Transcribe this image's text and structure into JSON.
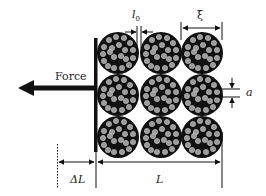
{
  "diagram": {
    "type": "mechanical-schematic",
    "labels": {
      "force": "Force",
      "l0": "l",
      "l0_subscript": "0",
      "xi": "ξ",
      "a": "a",
      "delta_L": "ΔL",
      "L": "L"
    },
    "grid": {
      "rows": 3,
      "cols": 3
    },
    "colors": {
      "line": "#111111",
      "bundle_fill": "#111111",
      "fiber_fill": "#9a9a9a",
      "fiber_stroke": "#cfcfcf",
      "background": "#ffffff"
    }
  }
}
